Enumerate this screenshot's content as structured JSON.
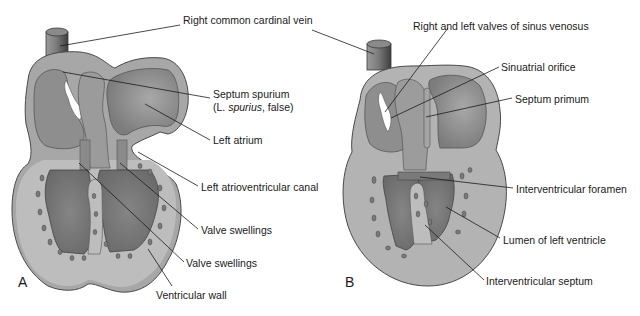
{
  "figure": {
    "panels": [
      {
        "id": "A",
        "letter": "A",
        "labels": [
          {
            "key": "right_common_cardinal_vein",
            "text": "Right common cardinal vein",
            "x": 183,
            "y": 20
          },
          {
            "key": "septum_spurium",
            "text": "Septum spurium",
            "x": 213,
            "y": 94
          },
          {
            "key": "septum_spurium_note_prefix",
            "text": "(L. ",
            "x": 213,
            "y": 107
          },
          {
            "key": "septum_spurium_note_italic",
            "text": "spurius",
            "x": 0,
            "y": 0
          },
          {
            "key": "septum_spurium_note_suffix",
            "text": ", false)",
            "x": 0,
            "y": 0
          },
          {
            "key": "left_atrium",
            "text": "Left atrium",
            "x": 213,
            "y": 137
          },
          {
            "key": "left_atrioventricular_canal",
            "text": "Left atrioventricular canal",
            "x": 201,
            "y": 182
          },
          {
            "key": "valve_swellings_upper",
            "text": "Valve swellings",
            "x": 201,
            "y": 225
          },
          {
            "key": "valve_swellings_lower",
            "text": "Valve swellings",
            "x": 186,
            "y": 257
          },
          {
            "key": "ventricular_wall",
            "text": "Ventricular wall",
            "x": 156,
            "y": 289
          }
        ]
      },
      {
        "id": "B",
        "letter": "B",
        "labels": [
          {
            "key": "right_and_left_valves_of_sinus_venosus",
            "text": "Right and left valves of sinus venosus",
            "x": 413,
            "y": 20
          },
          {
            "key": "sinuatrial_orifice",
            "text": "Sinuatrial orifice",
            "x": 501,
            "y": 61
          },
          {
            "key": "septum_primum",
            "text": "Septum primum",
            "x": 515,
            "y": 93
          },
          {
            "key": "interventricular_foramen",
            "text": "Interventricular foramen",
            "x": 516,
            "y": 183
          },
          {
            "key": "lumen_of_left_ventricle",
            "text": "Lumen of left ventricle",
            "x": 503,
            "y": 234
          },
          {
            "key": "interventricular_septum",
            "text": "Interventricular septum",
            "x": 486,
            "y": 275
          }
        ]
      }
    ],
    "colors": {
      "background": "#ffffff",
      "wall_fill": "#a9a9a9",
      "wall_stroke": "#4a4a4a",
      "chamber_fill": "#8c8c8c",
      "chamber_dark": "#727272",
      "chamber_light": "#b4b4b4",
      "myocardium_fill": "#bdbdbd",
      "trabecula_fill": "#7a7a7a",
      "leader_line": "#1a1a1a",
      "label_text": "#1a1a1a"
    }
  }
}
